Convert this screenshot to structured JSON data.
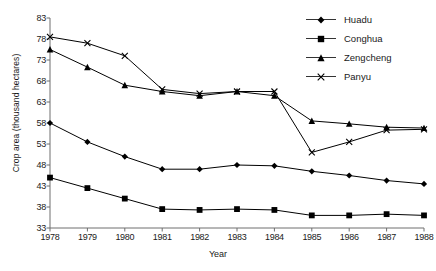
{
  "chart_data": {
    "type": "line",
    "title": "",
    "xlabel": "Year",
    "ylabel": "Crop area (thousand hectares)",
    "categories": [
      1978,
      1979,
      1980,
      1981,
      1982,
      1983,
      1984,
      1985,
      1986,
      1987,
      1988
    ],
    "x_tick_labels": [
      "1978",
      "1979",
      "1980",
      "1981",
      "1982",
      "1983",
      "1984",
      "1985",
      "1986",
      "1987",
      "1988"
    ],
    "y_tick_labels": [
      "33",
      "38",
      "43",
      "48",
      "53",
      "58",
      "63",
      "68",
      "73",
      "78",
      "83"
    ],
    "y_ticks": [
      33,
      38,
      43,
      48,
      53,
      58,
      63,
      68,
      73,
      78,
      83
    ],
    "ylim": [
      33,
      83
    ],
    "xlim": [
      1978,
      1988
    ],
    "grid": false,
    "legend_position": "top-right",
    "series": [
      {
        "name": "Huadu",
        "marker": "diamond",
        "color": "#000000",
        "values": [
          58.0,
          53.5,
          50.0,
          47.0,
          47.0,
          48.0,
          47.8,
          46.5,
          45.5,
          44.3,
          43.5
        ]
      },
      {
        "name": "Conghua",
        "marker": "square",
        "color": "#000000",
        "values": [
          45.0,
          42.5,
          40.0,
          37.5,
          37.3,
          37.5,
          37.3,
          36.0,
          36.0,
          36.3,
          36.0
        ]
      },
      {
        "name": "Zengcheng",
        "marker": "triangle",
        "color": "#000000",
        "values": [
          75.5,
          71.3,
          67.0,
          65.5,
          64.5,
          65.5,
          64.5,
          58.5,
          57.8,
          57.0,
          56.8
        ]
      },
      {
        "name": "Panyu",
        "marker": "cross",
        "color": "#000000",
        "values": [
          78.5,
          77.0,
          74.0,
          66.0,
          65.0,
          65.5,
          65.5,
          51.0,
          53.5,
          56.3,
          56.5
        ]
      }
    ]
  },
  "legend": {
    "items": [
      {
        "label": "Huadu",
        "marker": "diamond"
      },
      {
        "label": "Conghua",
        "marker": "square"
      },
      {
        "label": "Zengcheng",
        "marker": "triangle"
      },
      {
        "label": "Panyu",
        "marker": "cross"
      }
    ]
  }
}
